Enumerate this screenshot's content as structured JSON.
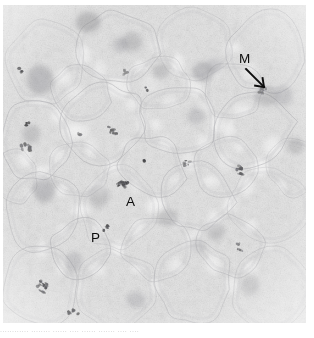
{
  "figure": {
    "kind": "light-micrograph",
    "width_px": 314,
    "height_px": 338,
    "background_color": "#ffffff",
    "tissue_base_color": "#d9d9d9",
    "tissue_light_color": "#f2f2f2",
    "stain_color": "#6e6e72",
    "dark_chromatin_color": "#2a2a2e",
    "annotation_color": "#0d0d0d"
  },
  "annotations": {
    "metaphase": {
      "label": "M",
      "meaning": "metaphase figure",
      "x": 239,
      "y": 52,
      "leader_from_x": 246,
      "leader_from_y": 69,
      "leader_to_x": 264,
      "leader_to_y": 87
    },
    "anaphase": {
      "label": "A",
      "meaning": "anaphase figure",
      "x": 126,
      "y": 195,
      "target_x": 122,
      "target_y": 185
    },
    "prophase": {
      "label": "P",
      "meaning": "prophase figure",
      "x": 91,
      "y": 231,
      "target_x": 105,
      "target_y": 229
    }
  },
  "caption": {
    "clipped_line": "............  ........ ...... .... ......  ....... ....  ...."
  },
  "cell_outlines": [
    {
      "cx": 46,
      "cy": 62,
      "rx": 40,
      "ry": 44,
      "rot": -12
    },
    {
      "cx": 120,
      "cy": 48,
      "rx": 42,
      "ry": 38,
      "rot": 8
    },
    {
      "cx": 196,
      "cy": 44,
      "rx": 38,
      "ry": 36,
      "rot": -5
    },
    {
      "cx": 268,
      "cy": 52,
      "rx": 40,
      "ry": 42,
      "rot": 14
    },
    {
      "cx": 36,
      "cy": 140,
      "rx": 36,
      "ry": 40,
      "rot": 5
    },
    {
      "cx": 104,
      "cy": 124,
      "rx": 44,
      "ry": 40,
      "rot": -18
    },
    {
      "cx": 180,
      "cy": 120,
      "rx": 40,
      "ry": 38,
      "rot": 10
    },
    {
      "cx": 252,
      "cy": 128,
      "rx": 42,
      "ry": 40,
      "rot": -8
    },
    {
      "cx": 44,
      "cy": 212,
      "rx": 38,
      "ry": 40,
      "rot": 16
    },
    {
      "cx": 118,
      "cy": 208,
      "rx": 42,
      "ry": 42,
      "rot": -6
    },
    {
      "cx": 196,
      "cy": 196,
      "rx": 38,
      "ry": 36,
      "rot": 9
    },
    {
      "cx": 268,
      "cy": 206,
      "rx": 40,
      "ry": 38,
      "rot": -14
    },
    {
      "cx": 40,
      "cy": 288,
      "rx": 40,
      "ry": 40,
      "rot": 4
    },
    {
      "cx": 116,
      "cy": 290,
      "rx": 42,
      "ry": 40,
      "rot": -10
    },
    {
      "cx": 194,
      "cy": 282,
      "rx": 40,
      "ry": 42,
      "rot": 12
    },
    {
      "cx": 270,
      "cy": 288,
      "rx": 40,
      "ry": 40,
      "rot": -4
    },
    {
      "cx": 152,
      "cy": 166,
      "rx": 34,
      "ry": 30,
      "rot": 20
    },
    {
      "cx": 226,
      "cy": 166,
      "rx": 32,
      "ry": 30,
      "rot": -16
    },
    {
      "cx": 78,
      "cy": 170,
      "rx": 32,
      "ry": 28,
      "rot": 6
    },
    {
      "cx": 158,
      "cy": 248,
      "rx": 36,
      "ry": 32,
      "rot": -12
    },
    {
      "cx": 232,
      "cy": 246,
      "rx": 34,
      "ry": 32,
      "rot": 14
    },
    {
      "cx": 80,
      "cy": 250,
      "rx": 32,
      "ry": 30,
      "rot": -20
    },
    {
      "cx": 160,
      "cy": 84,
      "rx": 32,
      "ry": 28,
      "rot": 10
    },
    {
      "cx": 232,
      "cy": 92,
      "rx": 30,
      "ry": 30,
      "rot": -8
    },
    {
      "cx": 80,
      "cy": 92,
      "rx": 30,
      "ry": 28,
      "rot": 18
    },
    {
      "cx": 294,
      "cy": 166,
      "rx": 26,
      "ry": 30,
      "rot": 0
    },
    {
      "cx": 14,
      "cy": 176,
      "rx": 24,
      "ry": 28,
      "rot": 0
    }
  ],
  "diffuse_nuclei": [
    {
      "cx": 40,
      "cy": 80,
      "r": 13,
      "o": 0.3
    },
    {
      "cx": 88,
      "cy": 22,
      "r": 11,
      "o": 0.34
    },
    {
      "cx": 132,
      "cy": 42,
      "r": 9,
      "o": 0.26
    },
    {
      "cx": 203,
      "cy": 72,
      "r": 11,
      "o": 0.3
    },
    {
      "cx": 214,
      "cy": 66,
      "r": 8,
      "o": 0.28
    },
    {
      "cx": 161,
      "cy": 71,
      "r": 8,
      "o": 0.24
    },
    {
      "cx": 120,
      "cy": 45,
      "r": 7,
      "o": 0.22
    },
    {
      "cx": 266,
      "cy": 96,
      "r": 11,
      "o": 0.26
    },
    {
      "cx": 31,
      "cy": 134,
      "r": 10,
      "o": 0.24
    },
    {
      "cx": 196,
      "cy": 116,
      "r": 9,
      "o": 0.22
    },
    {
      "cx": 44,
      "cy": 190,
      "r": 11,
      "o": 0.3
    },
    {
      "cx": 99,
      "cy": 196,
      "r": 10,
      "o": 0.26
    },
    {
      "cx": 168,
      "cy": 218,
      "r": 10,
      "o": 0.24
    },
    {
      "cx": 216,
      "cy": 232,
      "r": 10,
      "o": 0.26
    },
    {
      "cx": 198,
      "cy": 246,
      "r": 9,
      "o": 0.24
    },
    {
      "cx": 74,
      "cy": 262,
      "r": 9,
      "o": 0.22
    },
    {
      "cx": 296,
      "cy": 146,
      "r": 9,
      "o": 0.26
    },
    {
      "cx": 284,
      "cy": 96,
      "r": 9,
      "o": 0.22
    },
    {
      "cx": 250,
      "cy": 286,
      "r": 9,
      "o": 0.2
    },
    {
      "cx": 136,
      "cy": 300,
      "r": 9,
      "o": 0.22
    }
  ],
  "mitotic_figures": [
    {
      "cx": 122,
      "cy": 185,
      "w": 13,
      "h": 8,
      "rot": -22,
      "o": 0.8,
      "name": "anaphase-chromatin"
    },
    {
      "cx": 105,
      "cy": 228,
      "w": 7,
      "h": 7,
      "rot": 10,
      "o": 0.72,
      "name": "prophase-chromatin"
    },
    {
      "cx": 263,
      "cy": 90,
      "w": 9,
      "h": 6,
      "rot": -20,
      "o": 0.45,
      "name": "metaphase-chromatin"
    },
    {
      "cx": 113,
      "cy": 130,
      "w": 11,
      "h": 7,
      "rot": 8,
      "o": 0.62,
      "name": "mitotic-figure"
    },
    {
      "cx": 42,
      "cy": 287,
      "w": 9,
      "h": 11,
      "rot": 30,
      "o": 0.82,
      "name": "mitotic-figure"
    },
    {
      "cx": 26,
      "cy": 148,
      "w": 9,
      "h": 9,
      "rot": 70,
      "o": 0.58,
      "name": "mitotic-figure"
    },
    {
      "cx": 186,
      "cy": 163,
      "w": 8,
      "h": 5,
      "rot": -10,
      "o": 0.6,
      "name": "mitotic-figure"
    },
    {
      "cx": 240,
      "cy": 170,
      "w": 7,
      "h": 9,
      "rot": 18,
      "o": 0.66,
      "name": "mitotic-figure"
    },
    {
      "cx": 73,
      "cy": 313,
      "w": 8,
      "h": 7,
      "rot": -30,
      "o": 0.74,
      "name": "mitotic-figure"
    },
    {
      "cx": 240,
      "cy": 247,
      "w": 7,
      "h": 6,
      "rot": 24,
      "o": 0.5,
      "name": "mitotic-figure"
    },
    {
      "cx": 124,
      "cy": 72,
      "w": 7,
      "h": 5,
      "rot": -14,
      "o": 0.46,
      "name": "mitotic-figure"
    },
    {
      "cx": 21,
      "cy": 70,
      "w": 4,
      "h": 4,
      "rot": 0,
      "o": 0.85,
      "name": "dark-speck"
    },
    {
      "cx": 27,
      "cy": 124,
      "w": 4,
      "h": 4,
      "rot": 0,
      "o": 0.85,
      "name": "dark-speck"
    },
    {
      "cx": 144,
      "cy": 161,
      "w": 3,
      "h": 3,
      "rot": 0,
      "o": 0.8,
      "name": "dark-speck"
    },
    {
      "cx": 147,
      "cy": 89,
      "w": 3,
      "h": 4,
      "rot": 0,
      "o": 0.62,
      "name": "dark-speck"
    },
    {
      "cx": 79,
      "cy": 134,
      "w": 3,
      "h": 3,
      "rot": 0,
      "o": 0.55,
      "name": "dark-speck"
    }
  ]
}
